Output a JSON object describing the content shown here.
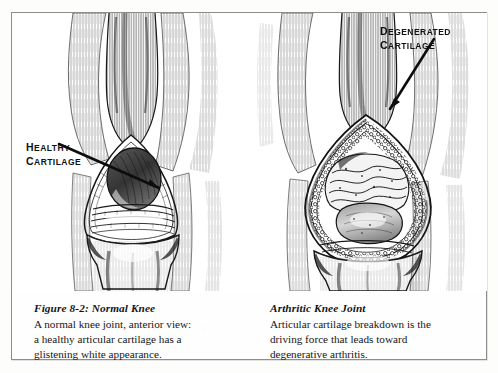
{
  "figure": {
    "frame_visible": true,
    "background_color": "#fefefe",
    "border_color": "#8d8d8d",
    "ink_color": "#151515"
  },
  "callouts": [
    {
      "id": "healthy-cartilage",
      "line1": "HEALTHY",
      "line2": "CARTILAGE",
      "points_to": "articular cartilage of normal knee"
    },
    {
      "id": "degenerated-cartilage",
      "line1": "DEGENERATED",
      "line2": "CARTILAGE",
      "points_to": "eroded cartilage of arthritic knee"
    }
  ],
  "panels": [
    {
      "id": "normal-knee",
      "illustration_name": "normal-knee-anterior-view",
      "caption_title": "Figure 8-2:  Normal Knee",
      "caption_lines": [
        "A normal knee joint, anterior view:",
        "a healthy articular cartilage has a",
        "glistening white appearance."
      ]
    },
    {
      "id": "arthritic-knee",
      "illustration_name": "arthritic-knee-anterior-view",
      "caption_title": "Arthritic Knee Joint",
      "caption_lines": [
        "Articular cartilage breakdown is the",
        "driving force that leads toward",
        "degenerative arthritis."
      ]
    }
  ]
}
